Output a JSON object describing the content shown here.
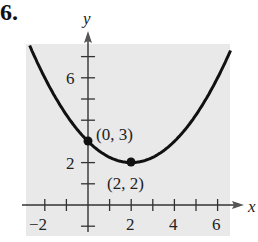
{
  "problem_number": "6.",
  "chart_data": {
    "type": "line",
    "title": "",
    "xlabel": "x",
    "ylabel": "y",
    "xlim": [
      -2.8,
      6.6
    ],
    "ylim": [
      -0.8,
      8.3
    ],
    "grid": false,
    "background": "#e9e9e9",
    "x_tick_labels": [
      "-2",
      "2",
      "4",
      "6"
    ],
    "x_ticks": [
      -2,
      -1,
      1,
      2,
      3,
      4,
      5,
      6
    ],
    "y_tick_labels": [
      "2",
      "6"
    ],
    "y_ticks": [
      -1,
      1,
      2,
      4,
      5,
      6,
      7
    ],
    "series": [
      {
        "name": "parabola",
        "equation": "y = (x-2)^2/4 + 2",
        "color": "#111111"
      }
    ],
    "points": [
      {
        "x": 0,
        "y": 3,
        "label": "(0, 3)"
      },
      {
        "x": 2,
        "y": 2,
        "label": "(2, 2)"
      }
    ]
  }
}
